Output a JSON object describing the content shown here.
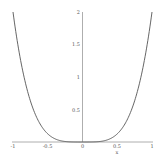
{
  "chart_data": {
    "type": "line",
    "title": "",
    "xlabel": "x",
    "ylabel": "",
    "xlim": [
      -1,
      1
    ],
    "ylim": [
      0,
      2
    ],
    "grid": false,
    "legend": null,
    "x_ticks": [
      "-1",
      "-0.5",
      "0",
      "0.5",
      "1"
    ],
    "y_ticks": [
      "0.5",
      "1",
      "1.5",
      "2"
    ],
    "series": [
      {
        "name": "f(x) = 2x^4",
        "color": "#555555",
        "x": [
          -1,
          -0.9,
          -0.8,
          -0.7,
          -0.6,
          -0.5,
          -0.4,
          -0.3,
          -0.2,
          -0.1,
          0,
          0.1,
          0.2,
          0.3,
          0.4,
          0.5,
          0.6,
          0.7,
          0.8,
          0.9,
          1
        ],
        "y": [
          2,
          1.312,
          0.819,
          0.48,
          0.259,
          0.125,
          0.051,
          0.016,
          0.003,
          0.0002,
          0,
          0.0002,
          0.003,
          0.016,
          0.051,
          0.125,
          0.259,
          0.48,
          0.819,
          1.312,
          2
        ]
      }
    ]
  },
  "axes": {
    "x_tick_labels": [
      "-1",
      "-0.5",
      "0",
      "0.5",
      "1"
    ],
    "y_tick_labels": [
      "0.5",
      "1",
      "1.5",
      "2"
    ],
    "x_axis_label": "x"
  }
}
